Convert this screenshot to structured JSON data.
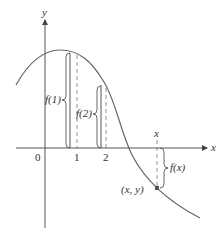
{
  "diagram": {
    "axes": {
      "x_label": "x",
      "y_label": "y",
      "origin_label": "0",
      "tick_labels": [
        "1",
        "2"
      ],
      "x_point_label": "x"
    },
    "annotations": {
      "f1": "f(1)",
      "f2": "f(2)",
      "fx": "f(x)",
      "point": "(x, y)"
    },
    "colors": {
      "curve": "#666666",
      "axis": "#555555",
      "text": "#333333"
    }
  }
}
